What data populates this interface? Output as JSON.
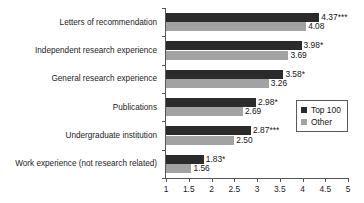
{
  "chart_data": {
    "type": "bar",
    "orientation": "horizontal",
    "title": "",
    "xlabel": "",
    "ylabel": "",
    "xlim": [
      1,
      5
    ],
    "xticks": [
      "1",
      "1.5",
      "2",
      "2.5",
      "3",
      "3.5",
      "4",
      "4.5",
      "5"
    ],
    "xtick_values": [
      1,
      1.5,
      2,
      2.5,
      3,
      3.5,
      4,
      4.5,
      5
    ],
    "grid": false,
    "legend_position": "right-middle",
    "categories": [
      "Letters of recommendation",
      "Independent research experience",
      "General research experience",
      "Publications",
      "Undergraduate institution",
      "Work experience (not research related)"
    ],
    "series": [
      {
        "name": "Top 100",
        "color": "#2b2b2b",
        "values": [
          4.37,
          3.98,
          3.58,
          2.98,
          2.87,
          1.83
        ],
        "labels": [
          "4.37***",
          "3.98*",
          "3.58*",
          "2.98*",
          "2.87***",
          "1.83*"
        ]
      },
      {
        "name": "Other",
        "color": "#a2a2a2",
        "values": [
          4.08,
          3.69,
          3.26,
          2.69,
          2.5,
          1.56
        ],
        "labels": [
          "4.08",
          "3.69",
          "3.26",
          "2.69",
          "2.50",
          "1.56"
        ]
      }
    ]
  },
  "legend": {
    "items": [
      {
        "label": "Top 100",
        "color": "#2b2b2b"
      },
      {
        "label": "Other",
        "color": "#a2a2a2"
      }
    ]
  }
}
